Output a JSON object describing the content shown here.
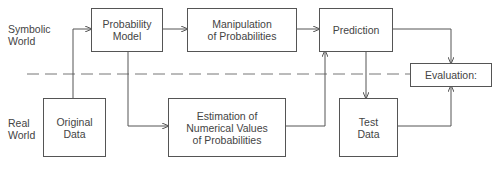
{
  "world_labels": {
    "symbolic": "Symbolic\nWorld",
    "real": "Real\nWorld"
  },
  "nodes": {
    "probability_model": "Probability\nModel",
    "manipulation": "Manipulation\nof Probabilities",
    "prediction": "Prediction",
    "evaluation": "Evaluation:",
    "original_data": "Original\nData",
    "estimation": "Estimation of\nNumerical Values\nof Probabilities",
    "test_data": "Test\nData"
  },
  "edges": [
    {
      "from": "Original Data",
      "to": "Probability Model"
    },
    {
      "from": "Probability Model",
      "to": "Manipulation of Probabilities"
    },
    {
      "from": "Probability Model",
      "to": "Estimation of Numerical Values of Probabilities"
    },
    {
      "from": "Manipulation of Probabilities",
      "to": "Prediction"
    },
    {
      "from": "Estimation of Numerical Values of Probabilities",
      "to": "Prediction"
    },
    {
      "from": "Prediction",
      "to": "Evaluation:"
    },
    {
      "from": "Prediction",
      "to": "Test Data"
    },
    {
      "from": "Test Data",
      "to": "Evaluation:"
    }
  ],
  "colors": {
    "line": "#555555",
    "text": "#444444",
    "background": "#ffffff"
  }
}
